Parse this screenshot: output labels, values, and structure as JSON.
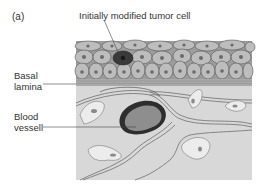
{
  "figure": {
    "panel_label": "(a)",
    "labels": {
      "tumor_cell": "Initially modified tumor cell",
      "basal_lamina": "Basal lamina",
      "blood_vessel": "Blood vessell"
    },
    "colors": {
      "epithelial_cell": "#b8b8b8",
      "epithelial_nucleus": "#6a6a6a",
      "tumor_cell": "#3a3a3a",
      "basal_lamina": "#a8a8a8",
      "connective_tissue": "#d6d6d6",
      "blood_vessel_wall": "#2e2e2e",
      "blood_vessel_lumen": "#8e8e8e",
      "fibroblast": "#ececec"
    }
  }
}
